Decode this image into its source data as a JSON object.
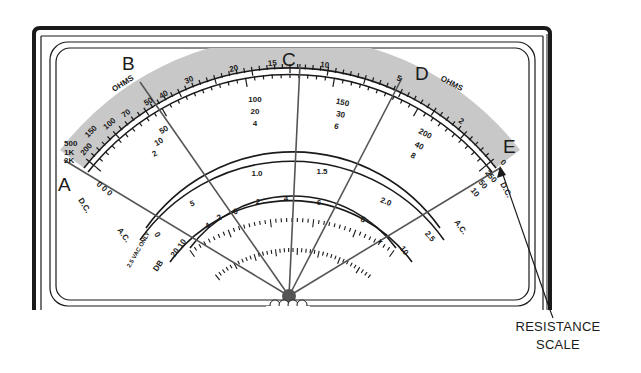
{
  "figure": {
    "colors": {
      "ink": "#1a1a1a",
      "resistance_band": "#c8c8c8",
      "background": "#ffffff",
      "pivot": "#555555"
    }
  },
  "point_labels": {
    "A": "A",
    "B": "B",
    "C": "C",
    "D": "D",
    "E": "E"
  },
  "ohms_scale": {
    "label_left": "OHMS",
    "label_right": "OHMS",
    "ticks": [
      "2K",
      "1K",
      "500",
      "200",
      "150",
      "100",
      "70",
      "50",
      "40",
      "30",
      "20",
      "15",
      "10",
      "5",
      "2",
      "0"
    ]
  },
  "dc_ac_scale": {
    "left_label_dc": "D.C.",
    "right_label_dc": "D.C.",
    "left_label_ac": "A.C.",
    "right_label_ac": "A.C.",
    "tick_columns": [
      {
        "top": "50",
        "mid": "10",
        "bot": "2"
      },
      {
        "top": "100",
        "mid": "20",
        "bot": "4"
      },
      {
        "top": "150",
        "mid": "30",
        "bot": "6"
      },
      {
        "top": "200",
        "mid": "40",
        "bot": "8"
      },
      {
        "top": "250",
        "mid": "50",
        "bot": "10"
      }
    ],
    "left_zeros": "0 0 0"
  },
  "ac_low_scale": {
    "ticks": [
      "0",
      "5",
      "1.0",
      "1.5",
      "2.0",
      "2.5"
    ],
    "note": "2.5 VAC ONLY"
  },
  "db_scale": {
    "label": "DB",
    "ticks": [
      "20",
      "10",
      "4",
      "2",
      "0",
      "2",
      "4",
      "6",
      "8",
      "10"
    ],
    "plus_sign": "+"
  },
  "callout": {
    "line1": "RESISTANCE",
    "line2": "SCALE"
  }
}
